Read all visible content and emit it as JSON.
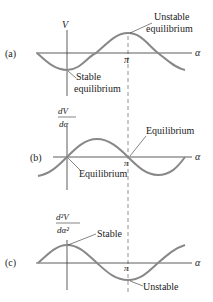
{
  "figure": {
    "colors": {
      "curve": "#888888",
      "axis": "#333333",
      "dashed": "#777777",
      "text": "#222222"
    },
    "axis_symbol": "α",
    "pi_label": "π",
    "panels": [
      {
        "id": "a",
        "tag": "(a)",
        "ylabel": "V",
        "function": "-cos(α)",
        "annotations": [
          {
            "text_line1": "Unstable",
            "text_line2": "equilibrium",
            "at": "α=π (max)"
          },
          {
            "text_line1": "Stable",
            "text_line2": "equilibrium",
            "at": "α=0 (min)"
          }
        ]
      },
      {
        "id": "b",
        "tag": "(b)",
        "ylabel_num": "dV",
        "ylabel_den": "dα",
        "function": "sin(α)",
        "annotations": [
          {
            "text": "Equilibrium",
            "at": "α=π (zero)"
          },
          {
            "text": "Equilibrium",
            "at": "α=0 (zero)"
          }
        ]
      },
      {
        "id": "c",
        "tag": "(c)",
        "ylabel_num": "d²V",
        "ylabel_den": "dα²",
        "function": "cos(α)",
        "annotations": [
          {
            "text": "Stable",
            "at": "α=0 (max)"
          },
          {
            "text": "Unstable",
            "at": "α=π (min)"
          }
        ]
      }
    ]
  }
}
